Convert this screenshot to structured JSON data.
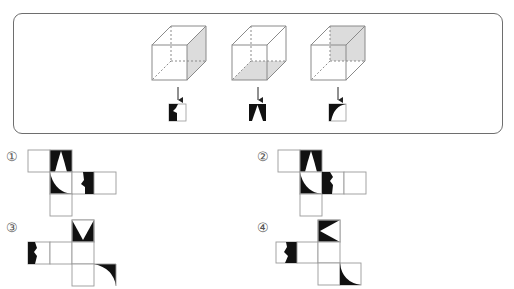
{
  "problem": {
    "type": "cube-net-matching",
    "cubes": [
      {
        "id": 1,
        "shaded_face": "right",
        "view_pattern": "black-left-half-with-notch"
      },
      {
        "id": 2,
        "shaded_face": "bottom",
        "view_pattern": "white-triangle-on-black"
      },
      {
        "id": 3,
        "shaded_face": "back",
        "view_pattern": "black-top-left-concave-corner"
      }
    ],
    "options": [
      {
        "label": "①",
        "id": 1
      },
      {
        "label": "②",
        "id": 2
      },
      {
        "label": "③",
        "id": 3
      },
      {
        "label": "④",
        "id": 4
      }
    ]
  },
  "colors": {
    "line": "#8a8a8a",
    "shade": "#d9d9d9",
    "ink": "#111111",
    "frame": "#6e6e6e"
  }
}
